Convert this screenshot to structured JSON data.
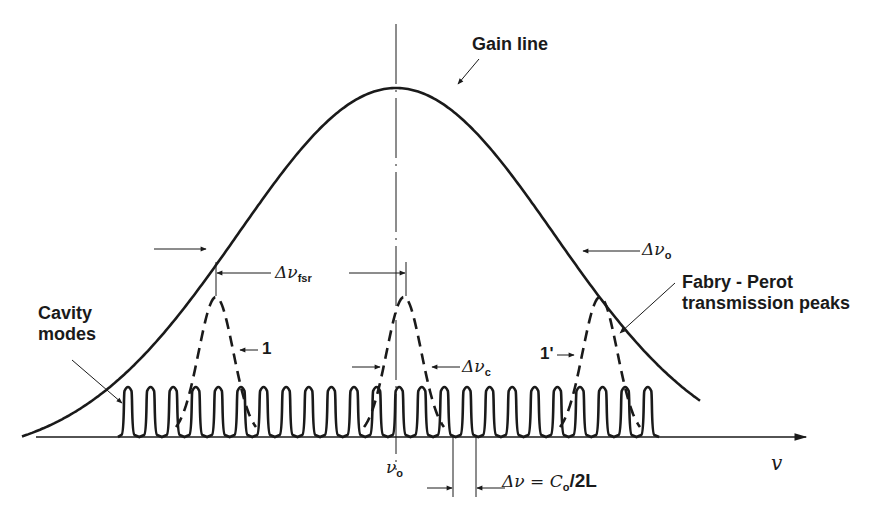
{
  "diagram": {
    "labels": {
      "gain_line": "Gain line",
      "cavity_modes_line1": "Cavity",
      "cavity_modes_line2": "modes",
      "fp_line1": "Fabry - Perot",
      "fp_line2": "transmission peaks",
      "delta_nu_fsr": "Δν",
      "delta_nu_fsr_sub": "fsr",
      "delta_nu_o": "Δν",
      "delta_nu_o_sub": "o",
      "delta_nu_c": "Δν",
      "delta_nu_c_sub": "c",
      "peak_1": "1",
      "peak_1_prime": "1'",
      "nu_o": "ν",
      "nu_o_sub": "o",
      "mode_spacing": "Δν = C",
      "mode_spacing_sub": "o",
      "mode_spacing_tail": "/2L",
      "axis_label": "v"
    },
    "colors": {
      "ink": "#1a1a1a",
      "background": "#ffffff"
    },
    "geometry": {
      "baseline_y": 437,
      "axis_x_start": 36,
      "axis_x_end": 806,
      "gain_center_x": 396,
      "gain_peak_y": 66,
      "gain_sigma_px": 158,
      "gain_x_range": [
        22,
        700
      ],
      "cavity_modes": {
        "count": 24,
        "first_x": 128,
        "spacing": 22.6,
        "peak_y": 389,
        "half_width": 4.5
      },
      "fp_peaks": [
        {
          "id": "1",
          "center_x": 216,
          "top_y": 297,
          "half_width": 40
        },
        {
          "id": "0",
          "center_x": 404,
          "top_y": 297,
          "half_width": 40
        },
        {
          "id": "1'",
          "center_x": 600,
          "top_y": 297,
          "half_width": 40
        }
      ]
    }
  }
}
